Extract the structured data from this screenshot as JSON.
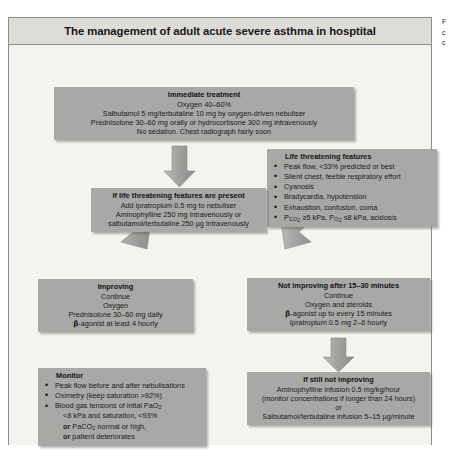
{
  "figure": {
    "title": "The management of adult acute severe asthma in hosptital",
    "side_caption_lines": [
      "F",
      "c",
      "c"
    ]
  },
  "boxes": {
    "immediate": {
      "header": "Immediate treatment",
      "lines": [
        "Oxygen 40–60%",
        "Salbutamol 5 mg/terbutaline 10 mg by oxygen-driven nebuliser",
        "Prednisolone 30–60 mg orally or hydrocortisone 300 mg intravenously",
        "No sedation. Chest radiograph fairly soon"
      ]
    },
    "life_threatening": {
      "header": "Life threatening features",
      "bullets": [
        "Peak flow, <33% predicted or best",
        "Silent chest, feeble respiratory effort",
        "Cyanosis",
        "Bradycardia, hypotension",
        "Exhaustion, confusion, coma",
        "PCO2 ≥5 kPa, PO2 ≤8 kPa, acidosis"
      ]
    },
    "if_life_threatening": {
      "header": "If life threatening features are present",
      "lines": [
        "Add ipratropium 0.5 mg to nebuliser",
        "Aminophylline 250 mg intravenously or",
        "salbutamol/terbutaline 250 µg intravenously"
      ]
    },
    "improving": {
      "header": "Improving",
      "lines": [
        "Continue",
        "Oxygen",
        "Prednisolone 30–60 mg daily",
        "β-agonist at least 4 hourly"
      ]
    },
    "not_improving": {
      "header": "Not improving after 15–30 minutes",
      "lines": [
        "Continue",
        "Oxygen and steroids",
        "β-agonist up to every 15 minutes",
        "Ipratropium 0.5 mg 2–6 hourly"
      ]
    },
    "monitor": {
      "header": "Monitor",
      "bullets": [
        "Peak flow before and after nebulisations",
        "Oximetry (keep saturation >92%)",
        "Blood gas tensions of intial PaO2",
        "<8 kPa and saturation, <93%",
        "or PaCO2 normal or high,",
        "or patient deteriorates"
      ]
    },
    "still_not_improving": {
      "header": "If still not improving",
      "lines": [
        "Aminophylline infusion 0.5 mg/kg/hour",
        "(monitor concentrations if longer than 24 hours)",
        "or",
        "Salbutamol/terbutaline infusion 5–15 µg/minute"
      ]
    }
  },
  "colors": {
    "box_fill": "#a8a8a6",
    "panel_bg": "#f4f3f0",
    "title_bg": "#dedcd7",
    "border": "#8d8d8a",
    "arrow": "#9a9a98"
  }
}
